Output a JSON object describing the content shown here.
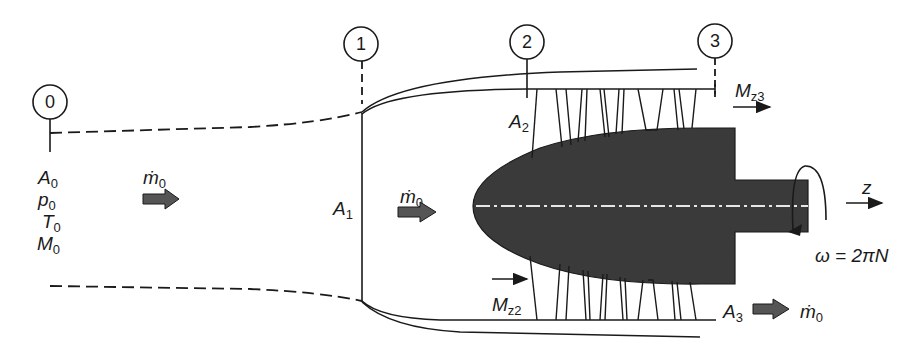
{
  "figure": {
    "stations": [
      {
        "id": "0",
        "label": "0"
      },
      {
        "id": "1",
        "label": "1"
      },
      {
        "id": "2",
        "label": "2"
      },
      {
        "id": "3",
        "label": "3"
      }
    ],
    "freestream": {
      "area": {
        "base": "A",
        "sub": "0"
      },
      "pressure": {
        "base": "p",
        "sub": "0"
      },
      "temperature": {
        "base": "T",
        "sub": "0"
      },
      "mach": {
        "base": "M",
        "sub": "0"
      }
    },
    "mass_flow_upstream": {
      "base": "ṁ",
      "sub": "0"
    },
    "mass_flow_inlet": {
      "base": "ṁ",
      "sub": "0"
    },
    "mass_flow_exit": {
      "base": "ṁ",
      "sub": "0"
    },
    "area_1": {
      "base": "A",
      "sub": "1"
    },
    "area_2": {
      "base": "A",
      "sub": "2"
    },
    "area_3": {
      "base": "A",
      "sub": "3"
    },
    "moment_2": {
      "base": "M",
      "sub": "z2"
    },
    "moment_3": {
      "base": "M",
      "sub": "z3"
    },
    "axis_label": "z",
    "rotation_label": "ω = 2πN",
    "colors": {
      "ink": "#1a1a1a",
      "hub_fill": "#3a3a3a",
      "arrow_fill": "#555555",
      "centerline": "#e6e6e6"
    }
  }
}
